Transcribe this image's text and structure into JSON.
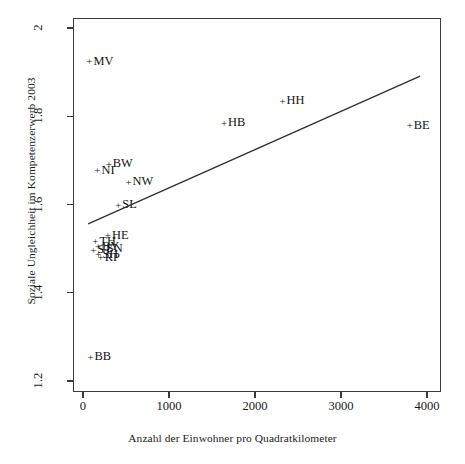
{
  "chart_data": {
    "type": "scatter",
    "title": "",
    "xlabel": "Anzahl der Einwohner pro Quadratkilometer",
    "ylabel": "Soziale Ungleichheit im Kompetenzerwerb 2003",
    "xlim": [
      0,
      4000
    ],
    "ylim": [
      1.2,
      2.0
    ],
    "xticks": [
      0,
      1000,
      2000,
      3000,
      4000
    ],
    "xticklabels": [
      "0",
      "1000",
      "2000",
      "3000",
      "4000"
    ],
    "yticks": [
      1.2,
      1.4,
      1.6,
      1.8,
      2.0
    ],
    "yticklabels": [
      "1.2",
      "1.4",
      "1.6",
      "1.8",
      "2"
    ],
    "grid": false,
    "legend": "none",
    "marker": "+",
    "points": [
      {
        "label": "MV",
        "x": 75,
        "y": 1.925
      },
      {
        "label": "HH",
        "x": 2320,
        "y": 1.835
      },
      {
        "label": "HB",
        "x": 1640,
        "y": 1.785
      },
      {
        "label": "BE",
        "x": 3800,
        "y": 1.78
      },
      {
        "label": "BW",
        "x": 300,
        "y": 1.692
      },
      {
        "label": "NI",
        "x": 168,
        "y": 1.678
      },
      {
        "label": "NW",
        "x": 530,
        "y": 1.652
      },
      {
        "label": "SL",
        "x": 410,
        "y": 1.6
      },
      {
        "label": "HE",
        "x": 290,
        "y": 1.53
      },
      {
        "label": "TH",
        "x": 145,
        "y": 1.517
      },
      {
        "label": "BY",
        "x": 175,
        "y": 1.505
      },
      {
        "label": "SN",
        "x": 230,
        "y": 1.5
      },
      {
        "label": "ST",
        "x": 120,
        "y": 1.497
      },
      {
        "label": "SH",
        "x": 180,
        "y": 1.487
      },
      {
        "label": "RP",
        "x": 205,
        "y": 1.48
      },
      {
        "label": "BB",
        "x": 88,
        "y": 1.255
      }
    ],
    "trendline": {
      "x_start": 60,
      "y_start": 1.556,
      "x_end": 3920,
      "y_end": 1.891
    }
  },
  "axis": {
    "x_ticks": [
      {
        "value": 0,
        "label": "0"
      },
      {
        "value": 1000,
        "label": "1000"
      },
      {
        "value": 2000,
        "label": "2000"
      },
      {
        "value": 3000,
        "label": "3000"
      },
      {
        "value": 4000,
        "label": "4000"
      }
    ],
    "y_ticks": [
      {
        "value": 1.2,
        "label": "1.2"
      },
      {
        "value": 1.4,
        "label": "1.4"
      },
      {
        "value": 1.6,
        "label": "1.6"
      },
      {
        "value": 1.8,
        "label": "1.8"
      },
      {
        "value": 2.0,
        "label": "2"
      }
    ]
  },
  "marker_glyph": "+"
}
